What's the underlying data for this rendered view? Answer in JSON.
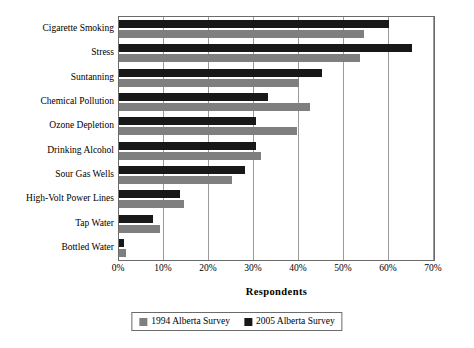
{
  "chart_data": {
    "type": "bar",
    "title": "",
    "xlabel": "Respondents",
    "ylabel": "",
    "orientation": "horizontal",
    "xlim": [
      0,
      70
    ],
    "xtick_labels": [
      "0%",
      "10%",
      "20%",
      "30%",
      "40%",
      "50%",
      "60%",
      "70%"
    ],
    "xticks": [
      0,
      10,
      20,
      30,
      40,
      50,
      60,
      70
    ],
    "grid": "vertical",
    "legend_position": "bottom",
    "categories": [
      "Cigarette Smoking",
      "Stress",
      "Suntanning",
      "Chemical Pollution",
      "Ozone Depletion",
      "Drinking Alcohol",
      "Sour Gas Wells",
      "High-Volt Power Lines",
      "Tap Water",
      "Bottled Water"
    ],
    "series": [
      {
        "name": "1994 Alberta Survey",
        "color": "#7f7f7f",
        "values": [
          54.5,
          53.5,
          40.0,
          42.5,
          39.5,
          31.5,
          25.0,
          14.5,
          9.0,
          1.5
        ]
      },
      {
        "name": "2005 Alberta Survey",
        "color": "#181818",
        "values": [
          60.0,
          65.0,
          45.0,
          33.0,
          30.5,
          30.5,
          28.0,
          13.5,
          7.5,
          1.0
        ]
      }
    ]
  }
}
